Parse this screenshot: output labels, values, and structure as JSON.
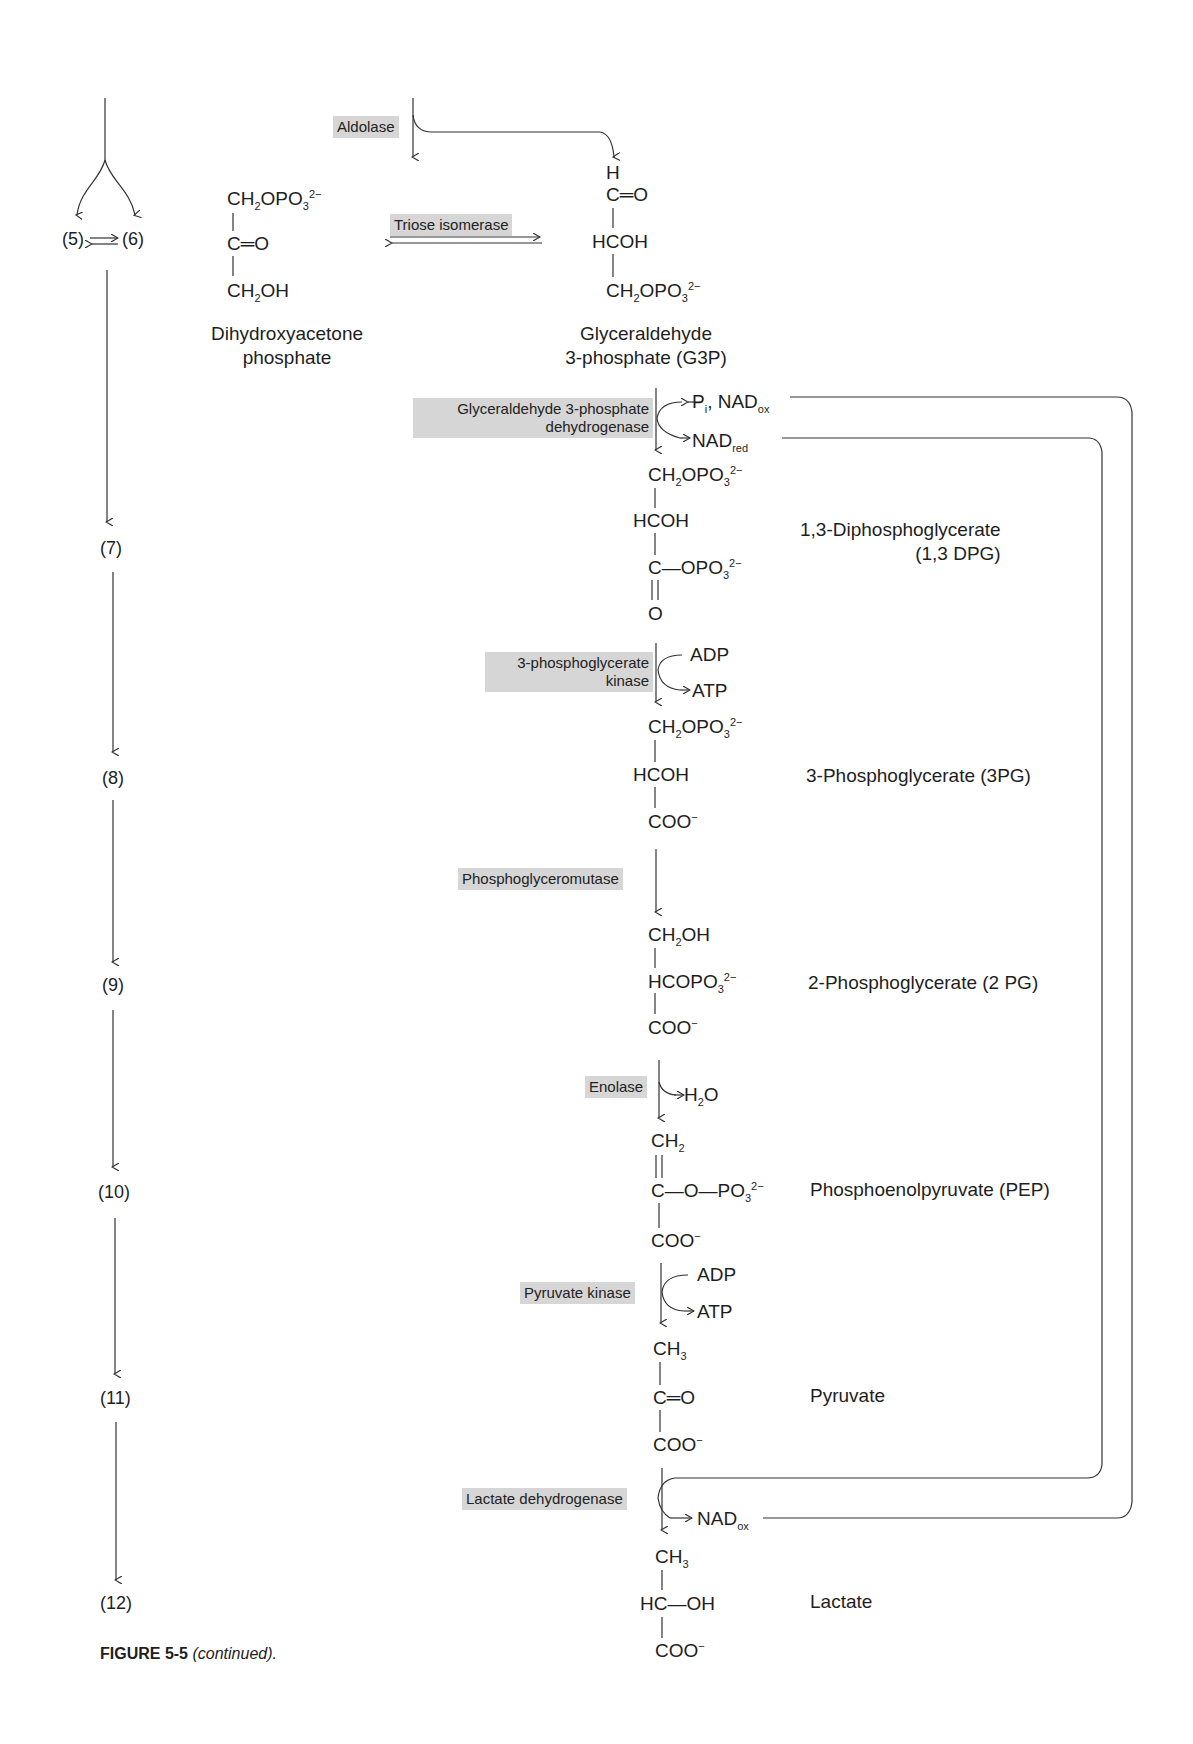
{
  "figure": {
    "caption_label": "FIGURE 5-5",
    "caption_note": "(continued)."
  },
  "steps": {
    "s5": "(5)",
    "s6": "(6)",
    "s7": "(7)",
    "s8": "(8)",
    "s9": "(9)",
    "s10": "(10)",
    "s11": "(11)",
    "s12": "(12)"
  },
  "enzymes": {
    "aldolase": "Aldolase",
    "triose_isomerase": "Triose isomerase",
    "g3pdh_line1": "Glyceraldehyde 3-phosphate",
    "g3pdh_line2": "dehydrogenase",
    "pgk_line1": "3-phosphoglycerate",
    "pgk_line2": "kinase",
    "pgm": "Phosphoglyceromutase",
    "enolase": "Enolase",
    "pyruvate_kinase": "Pyruvate kinase",
    "ldh": "Lactate dehydrogenase"
  },
  "compounds": {
    "dhap": {
      "name_line1": "Dihydroxyacetone",
      "name_line2": "phosphate"
    },
    "g3p": {
      "name_line1": "Glyceraldehyde",
      "name_line2": "3-phosphate (G3P)"
    },
    "dpg": {
      "name_line1": "1,3-Diphosphoglycerate",
      "name_line2": "(1,3 DPG)"
    },
    "pg3": {
      "name": "3-Phosphoglycerate (3PG)"
    },
    "pg2": {
      "name": "2-Phosphoglycerate (2 PG)"
    },
    "pep": {
      "name": "Phosphoenolpyruvate (PEP)"
    },
    "pyruvate": {
      "name": "Pyruvate"
    },
    "lactate": {
      "name": "Lactate"
    }
  },
  "cofactors": {
    "pi_nadox": "Pᵢ, NADₒₓ",
    "nadred": "NAD",
    "nadred_sub": "red",
    "adp": "ADP",
    "atp": "ATP",
    "h2o": "H₂O",
    "nadox": "NAD",
    "nadox_sub": "ox"
  }
}
